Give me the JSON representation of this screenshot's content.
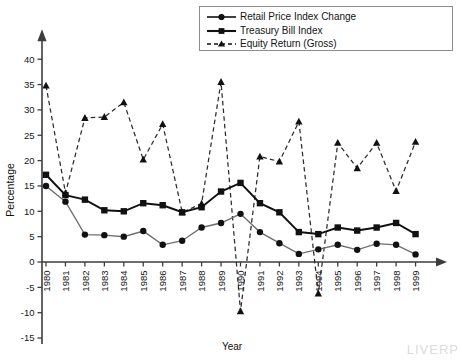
{
  "chart_data": {
    "type": "line",
    "title": "",
    "xlabel": "Year",
    "ylabel": "Percentage",
    "categories": [
      "1980",
      "1981",
      "1982",
      "1983",
      "1984",
      "1985",
      "1986",
      "1987",
      "1988",
      "1989",
      "1990",
      "1991",
      "1992",
      "1993",
      "1994",
      "1995",
      "1996",
      "1997",
      "1998",
      "1999"
    ],
    "ylim": [
      -15,
      40
    ],
    "yticks": [
      -15,
      -10,
      -5,
      0,
      5,
      10,
      15,
      20,
      25,
      30,
      35,
      40
    ],
    "grid": false,
    "legend_position": "top-right",
    "series": [
      {
        "name": "Retail Price Index Change",
        "marker": "circle",
        "linestyle": "solid",
        "color": "#6e6e6e",
        "values": [
          15.0,
          11.9,
          5.4,
          5.3,
          5.0,
          6.1,
          3.4,
          4.2,
          6.8,
          7.7,
          9.5,
          5.9,
          3.7,
          1.6,
          2.5,
          3.4,
          2.4,
          3.6,
          3.4,
          1.5
        ]
      },
      {
        "name": "Treasury Bill Index",
        "marker": "square",
        "linestyle": "solid",
        "color": "#111111",
        "values": [
          17.2,
          13.2,
          12.3,
          10.2,
          10.0,
          11.6,
          11.2,
          9.8,
          10.8,
          13.9,
          15.6,
          11.6,
          9.8,
          5.9,
          5.5,
          6.8,
          6.2,
          6.8,
          7.7,
          5.5
        ]
      },
      {
        "name": "Equity Return (Gross)",
        "marker": "triangle",
        "linestyle": "dashed",
        "color": "#2b2b2b",
        "values": [
          34.8,
          13.6,
          28.4,
          28.6,
          31.5,
          20.2,
          27.2,
          9.8,
          11.5,
          35.5,
          -9.7,
          20.8,
          19.8,
          27.7,
          -6.2,
          23.5,
          18.5,
          23.5,
          14.0,
          23.7
        ]
      }
    ]
  },
  "legend": {
    "items": [
      {
        "label": "Retail Price Index Change",
        "marker": "circle",
        "linestyle": "solid"
      },
      {
        "label": "Treasury Bill Index",
        "marker": "square",
        "linestyle": "solid"
      },
      {
        "label": "Equity Return (Gross)",
        "marker": "triangle",
        "linestyle": "dashed"
      }
    ]
  },
  "watermark": {
    "text": "LIVERP"
  }
}
